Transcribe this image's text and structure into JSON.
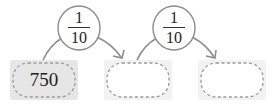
{
  "diagram": {
    "boxes": [
      {
        "value": "750",
        "filled": true
      },
      {
        "value": "",
        "filled": false
      },
      {
        "value": "",
        "filled": false
      }
    ],
    "operators": [
      {
        "numerator": "1",
        "denominator": "10"
      },
      {
        "numerator": "1",
        "denominator": "10"
      }
    ],
    "colors": {
      "box_fill_given": "#e6e6e6",
      "box_fill_empty": "#f2f2f2",
      "dash_stroke": "#9a9a9a",
      "arrow_stroke": "#8c8c8c",
      "oval_stroke": "#8c8c8c"
    }
  }
}
